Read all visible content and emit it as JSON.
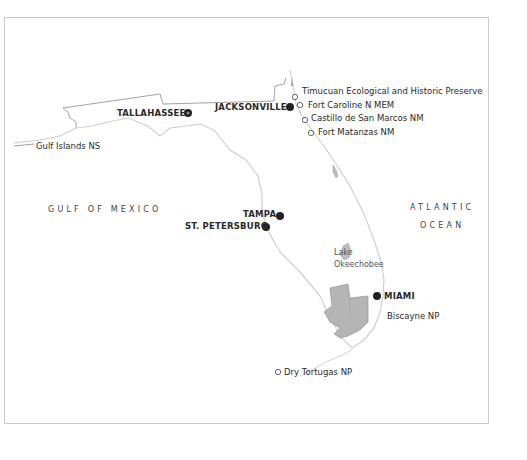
{
  "map": {
    "region": "Florida",
    "colors": {
      "frame_border": "#c9c9c9",
      "coastline": "#cfcfcf",
      "state_border": "#8a8a8a",
      "park_fill": "#b5b5b5",
      "lake_fill": "#bdbdbd",
      "city_dot": "#222222",
      "park_marker_stroke": "#444444"
    },
    "cities": [
      {
        "id": "tallahassee",
        "label": "TALLAHASSEE",
        "capital": true
      },
      {
        "id": "jacksonville",
        "label": "JACKSONVILLE",
        "capital": false
      },
      {
        "id": "tampa",
        "label": "TAMPA",
        "capital": false
      },
      {
        "id": "st-petersburg",
        "label": "ST. PETERSBURG",
        "capital": false
      },
      {
        "id": "miami",
        "label": "MIAMI",
        "capital": false
      }
    ],
    "parks": [
      {
        "id": "timucuan",
        "label": "Timucuan Ecological and Historic Preserve",
        "marker": "open-circle"
      },
      {
        "id": "fort-caroline",
        "label": "Fort Caroline N MEM",
        "marker": "open-circle"
      },
      {
        "id": "castillo",
        "label": "Castillo de San Marcos NM",
        "marker": "open-circle"
      },
      {
        "id": "fort-matanzas",
        "label": "Fort Matanzas NM",
        "marker": "open-circle"
      },
      {
        "id": "gulf-islands",
        "label": "Gulf Islands NS",
        "marker": "leader-line"
      },
      {
        "id": "biscayne",
        "label": "Biscayne NP",
        "marker": "none"
      },
      {
        "id": "dry-tortugas",
        "label": "Dry Tortugas NP",
        "marker": "open-circle"
      }
    ],
    "water_bodies": [
      {
        "id": "gulf",
        "lines": [
          "GULF OF MEXICO"
        ]
      },
      {
        "id": "atlantic",
        "lines": [
          "ATLANTIC",
          "OCEAN"
        ]
      },
      {
        "id": "okeechobee",
        "lines": [
          "Lake",
          "Okeechobee"
        ]
      }
    ]
  }
}
